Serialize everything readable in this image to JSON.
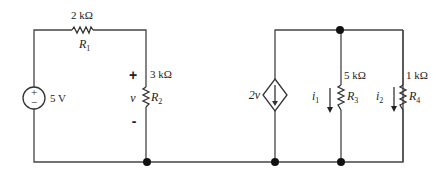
{
  "diagram": {
    "type": "circuit-schematic",
    "voltage_source": {
      "value": "5 V",
      "plus": "+",
      "minus": "−"
    },
    "resistors": [
      {
        "name": "R",
        "sub": "1",
        "value": "2 kΩ"
      },
      {
        "name": "R",
        "sub": "2",
        "value": "3 kΩ"
      },
      {
        "name": "R",
        "sub": "3",
        "value": "5 kΩ"
      },
      {
        "name": "R",
        "sub": "4",
        "value": "1 kΩ"
      }
    ],
    "voltage_label": {
      "plus": "+",
      "var": "v",
      "minus": "-"
    },
    "dependent_source": {
      "value": "2v"
    },
    "currents": [
      {
        "name": "i",
        "sub": "1"
      },
      {
        "name": "i",
        "sub": "2"
      }
    ],
    "colors": {
      "wire": "#444444",
      "node": "#111111",
      "background": "#ffffff"
    }
  }
}
